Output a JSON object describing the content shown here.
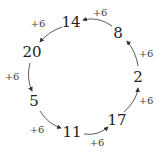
{
  "diagram": {
    "type": "cycle",
    "direction": "counterclockwise",
    "nodes": [
      {
        "id": "n14",
        "label": "14",
        "x": 71,
        "y": 22
      },
      {
        "id": "n20",
        "label": "20",
        "x": 31,
        "y": 52
      },
      {
        "id": "n5",
        "label": "5",
        "x": 34,
        "y": 101
      },
      {
        "id": "n11",
        "label": "11",
        "x": 72,
        "y": 131
      },
      {
        "id": "n17",
        "label": "17",
        "x": 118,
        "y": 120
      },
      {
        "id": "n2",
        "label": "2",
        "x": 138,
        "y": 77
      },
      {
        "id": "n8",
        "label": "8",
        "x": 118,
        "y": 33
      }
    ],
    "edges": [
      {
        "from": "n14",
        "to": "n20",
        "label": "+6",
        "lx": 38,
        "ly": 23
      },
      {
        "from": "n20",
        "to": "n5",
        "label": "+6",
        "lx": 12,
        "ly": 76
      },
      {
        "from": "n5",
        "to": "n11",
        "label": "+6",
        "lx": 37,
        "ly": 129
      },
      {
        "from": "n11",
        "to": "n17",
        "label": "+6",
        "lx": 97,
        "ly": 142
      },
      {
        "from": "n17",
        "to": "n2",
        "label": "+6",
        "lx": 146,
        "ly": 100
      },
      {
        "from": "n2",
        "to": "n8",
        "label": "+6",
        "lx": 146,
        "ly": 53
      },
      {
        "from": "n8",
        "to": "n14",
        "label": "+6",
        "lx": 100,
        "ly": 12
      }
    ]
  }
}
